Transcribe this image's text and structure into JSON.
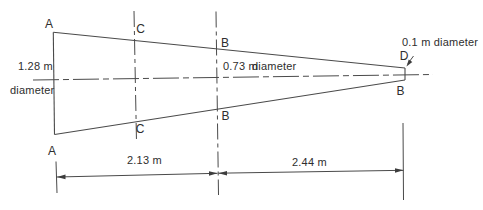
{
  "figure": {
    "background_color": "#ffffff",
    "line_color": "#4a4a4a",
    "text_color": "#2e2e2e"
  },
  "points": {
    "a_top": "A",
    "a_bottom": "A",
    "c_top": "C",
    "c_bottom": "C",
    "b_top": "B",
    "b_bottom": "B",
    "d_right": "D",
    "b_right": "B"
  },
  "dimensions": {
    "left_diameter_value": "1.28 m",
    "left_diameter_word": "diameter",
    "mid_diameter_value": "0.73 m",
    "mid_diameter_word": "diameter",
    "right_diameter": "0.1 m diameter",
    "span_left": "2.13 m",
    "span_right": "2.44 m"
  }
}
